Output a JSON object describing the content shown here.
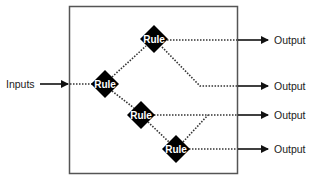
{
  "diagram": {
    "input_label": "Inputs",
    "rule_label": "Rule",
    "output_label": "Output",
    "rules": [
      {
        "id": "rule-top",
        "label": "Rule",
        "cx": 154,
        "cy": 39
      },
      {
        "id": "rule-entry",
        "label": "Rule",
        "cx": 105,
        "cy": 84
      },
      {
        "id": "rule-middle",
        "label": "Rule",
        "cx": 141,
        "cy": 115
      },
      {
        "id": "rule-bottom",
        "label": "Rule",
        "cx": 176,
        "cy": 149
      }
    ],
    "outputs": [
      {
        "label": "Output",
        "y": 40
      },
      {
        "label": "Output",
        "y": 86
      },
      {
        "label": "Output",
        "y": 115
      },
      {
        "label": "Output",
        "y": 149
      }
    ],
    "colors": {
      "box_border": "#555555",
      "diamond_fill": "#000000",
      "line": "#222222",
      "text": "#222222"
    }
  }
}
